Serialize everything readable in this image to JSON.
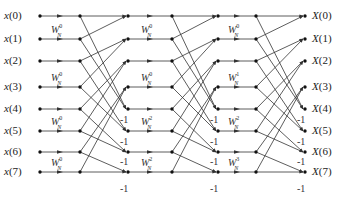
{
  "diagram": {
    "inputs": [
      "x(0)",
      "x(1)",
      "x(2)",
      "x(3)",
      "x(4)",
      "x(5)",
      "x(6)",
      "x(7)"
    ],
    "outputs": [
      "X(0)",
      "X(1)",
      "X(2)",
      "X(3)",
      "X(4)",
      "X(5)",
      "X(6)",
      "X(7)"
    ],
    "row_y": [
      16,
      39,
      61,
      87,
      109,
      131,
      152,
      172
    ],
    "columns": {
      "input_dot_x": 40,
      "stages": [
        {
          "left_x": 80,
          "right_x": 128
        },
        {
          "left_x": 172,
          "right_x": 218
        },
        {
          "left_x": 256,
          "right_x": 305
        }
      ],
      "output_label_x": 312
    },
    "twiddle_base": "W",
    "twiddle_sub": "N",
    "stages": [
      {
        "name": "stage-1",
        "twiddles": [
          {
            "row": 1,
            "exp": "0"
          },
          {
            "row": 3,
            "exp": "0"
          },
          {
            "row": 5,
            "exp": "0"
          },
          {
            "row": 7,
            "exp": "0"
          }
        ]
      },
      {
        "name": "stage-2",
        "twiddles": [
          {
            "row": 1,
            "exp": "0"
          },
          {
            "row": 3,
            "exp": "0"
          },
          {
            "row": 5,
            "exp": "2"
          },
          {
            "row": 7,
            "exp": "2"
          }
        ]
      },
      {
        "name": "stage-3",
        "twiddles": [
          {
            "row": 1,
            "exp": "0"
          },
          {
            "row": 3,
            "exp": "1"
          },
          {
            "row": 5,
            "exp": "2"
          },
          {
            "row": 7,
            "exp": "3"
          }
        ]
      }
    ],
    "negation_label": "-1",
    "negation_rows_y": [
      120,
      142,
      162,
      189
    ],
    "line_color": "#333333",
    "node_color": "#111111"
  }
}
